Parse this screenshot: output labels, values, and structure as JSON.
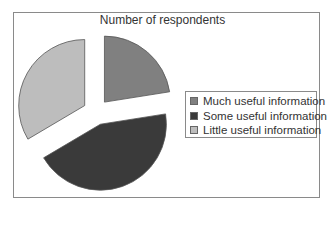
{
  "chart_data": {
    "type": "pie",
    "title": "Number of respondents",
    "categories": [
      "Much useful information",
      "Some useful information",
      "Little useful information"
    ],
    "values": [
      22.5,
      44,
      33.5
    ],
    "unit": "percent (estimated share of pie)",
    "colors": [
      "#808080",
      "#3a3a3a",
      "#bdbdbd"
    ],
    "exploded": true,
    "legend_position": "right"
  },
  "legend": {
    "items": [
      {
        "label": "Much useful information",
        "color": "#808080"
      },
      {
        "label": "Some useful information",
        "color": "#3a3a3a"
      },
      {
        "label": "Little useful information",
        "color": "#bdbdbd"
      }
    ]
  }
}
